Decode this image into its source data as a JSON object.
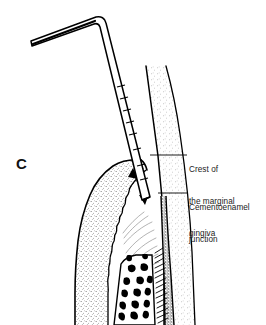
{
  "figure": {
    "panel_letter": "C",
    "background_color": "#ffffff",
    "ink_color": "#000000",
    "stipple_color": "#6b6b6b"
  },
  "callouts": [
    {
      "id": "crest-of-the-marginal-gingiva",
      "lines": [
        "Crest of",
        "the marginal",
        "gingiva"
      ],
      "leader": {
        "x1": 150,
        "y1": 155,
        "x2": 187,
        "y2": 155
      }
    },
    {
      "id": "cementoenamel-junction",
      "lines": [
        "Cementoenamel",
        "junction"
      ],
      "leader": {
        "x1": 158,
        "y1": 193,
        "x2": 187,
        "y2": 193
      }
    }
  ],
  "anatomy": {
    "probe_label": "periodontal-probe",
    "probe_graduations": 7,
    "gingiva_label": "marginal-gingiva",
    "tooth_label": "tooth-crown",
    "root_label": "root-surface-cementum",
    "bone_label": "alveolar-bone",
    "ligament_label": "periodontal-ligament",
    "sulcus_arrow_label": "sulcus-depth-arrow"
  }
}
